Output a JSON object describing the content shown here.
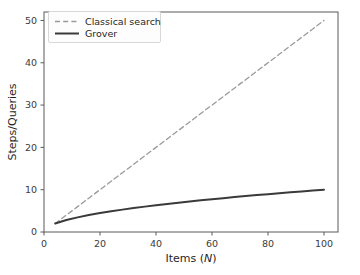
{
  "chart_data": {
    "type": "line",
    "title": "",
    "xlabel": "Items (N)",
    "xlabel_main": "Items (",
    "xlabel_italic": "N",
    "xlabel_tail": ")",
    "ylabel": "Steps/Queries",
    "xlim": [
      0,
      105
    ],
    "ylim": [
      0,
      52
    ],
    "grid": false,
    "legend_position": "upper left",
    "xticks": [
      0,
      20,
      40,
      60,
      80,
      100
    ],
    "xtick_labels": [
      "0",
      "20",
      "40",
      "60",
      "80",
      "100"
    ],
    "yticks": [
      0,
      10,
      20,
      30,
      40,
      50
    ],
    "ytick_labels": [
      "0",
      "10",
      "20",
      "30",
      "40",
      "50"
    ],
    "x": [
      4,
      8,
      12,
      16,
      20,
      24,
      28,
      32,
      36,
      40,
      44,
      48,
      52,
      56,
      60,
      64,
      68,
      72,
      76,
      80,
      84,
      88,
      92,
      96,
      100
    ],
    "series": [
      {
        "name": "Classical search",
        "style": "dashed",
        "color": "#9a9a9a",
        "linewidth": 1.3,
        "formula": "N/2",
        "values": [
          2,
          4,
          6,
          8,
          10,
          12,
          14,
          16,
          18,
          20,
          22,
          24,
          26,
          28,
          30,
          32,
          34,
          36,
          38,
          40,
          42,
          44,
          46,
          48,
          50
        ]
      },
      {
        "name": "Grover",
        "style": "solid",
        "color": "#3a3a3a",
        "linewidth": 2.0,
        "formula": "sqrt(N)",
        "values": [
          2,
          2.83,
          3.46,
          4,
          4.47,
          4.9,
          5.29,
          5.66,
          6,
          6.32,
          6.63,
          6.93,
          7.21,
          7.48,
          7.75,
          8,
          8.25,
          8.49,
          8.72,
          8.94,
          9.17,
          9.38,
          9.59,
          9.8,
          10
        ]
      }
    ]
  },
  "legend": {
    "entries": [
      {
        "label": "Classical search"
      },
      {
        "label": "Grover"
      }
    ]
  },
  "colors": {
    "background": "#ffffff",
    "spine": "#5a5a5a",
    "tick_text": "#3b3b3b",
    "axis_title": "#1f1f1f",
    "legend_border": "#d8d8d8",
    "legend_bg": "#fdfdfd",
    "classical": "#9a9a9a",
    "grover": "#3a3a3a"
  }
}
